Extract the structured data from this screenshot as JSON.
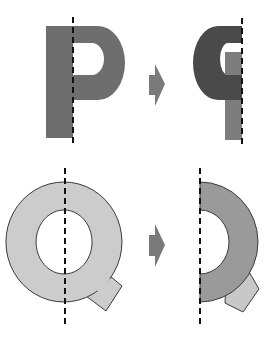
{
  "diagram": {
    "colors": {
      "background": "#ffffff",
      "p_original": "#6e6e6e",
      "p_mirror_bowl": "#4a4a4a",
      "p_mirror_stem": "#7d7d7d",
      "q_original": "#cccccc",
      "q_mirror_ring": "#9a9a9a",
      "q_mirror_tail": "#c8c8c8",
      "outline": "#3a3a3a",
      "axis": "#111111",
      "arrow": "#7a7a7a"
    },
    "rows": [
      {
        "letter": "P",
        "original_label": "P",
        "result_label": "mirrored P",
        "arrow": "right-arrow"
      },
      {
        "letter": "Q",
        "original_label": "Q",
        "result_label": "half of mirrored Q",
        "arrow": "right-arrow"
      }
    ]
  }
}
